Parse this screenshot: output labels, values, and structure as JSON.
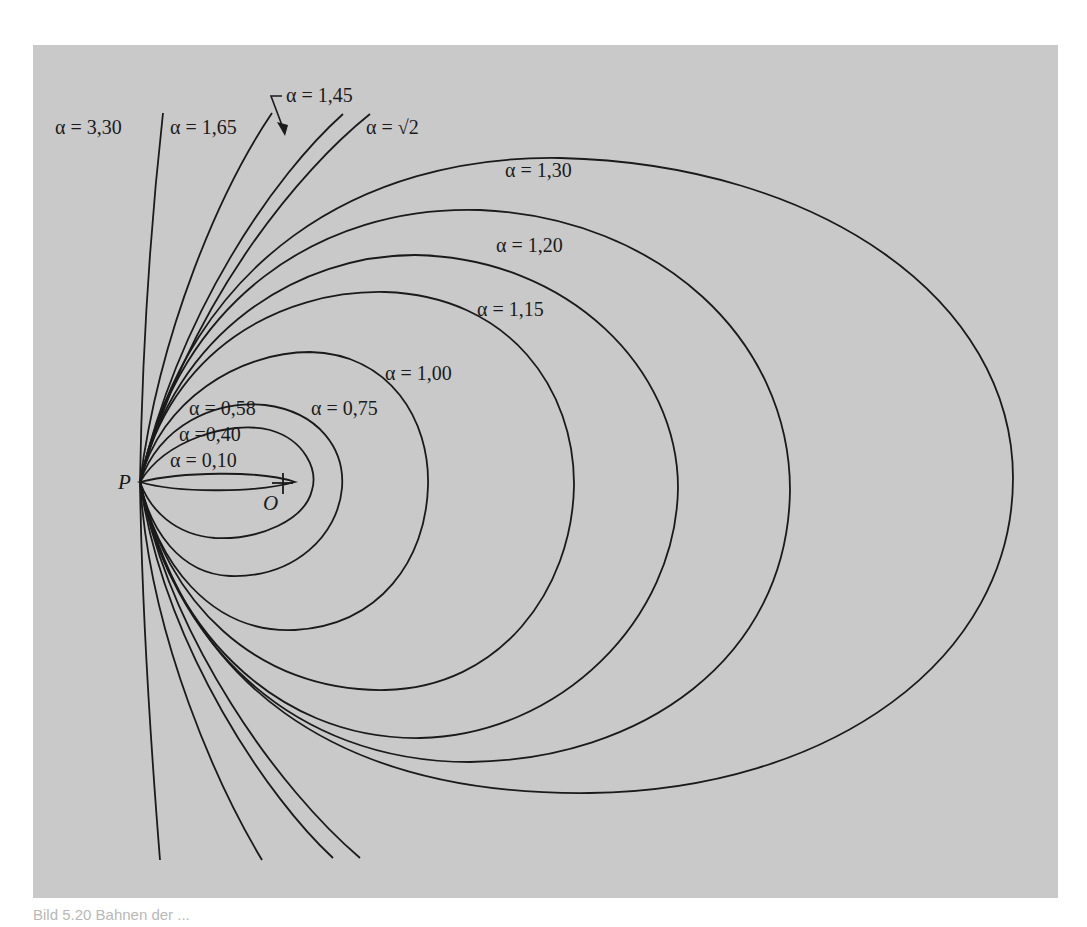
{
  "figure": {
    "point_P": "P",
    "point_O": "O",
    "labels": {
      "a330": "α = 3,30",
      "a165": "α = 1,65",
      "a145": "α = 1,45",
      "asqrt2": "α = √2",
      "a130": "α = 1,30",
      "a120": "α = 1,20",
      "a115": "α = 1,15",
      "a100": "α = 1,00",
      "a075": "α = 0,75",
      "a058": "α = 0,58",
      "a040": "α =0,40",
      "a010": "α = 0,10"
    },
    "caption": "Bild 5.20  Bahnen der ..."
  },
  "diagram": {
    "type": "family-of-curves",
    "parameter": "α",
    "closed_curves": [
      0.1,
      0.4,
      0.58,
      0.75,
      1.0,
      1.15,
      1.2,
      1.3
    ],
    "open_curves": [
      1.4142,
      1.45,
      1.65,
      3.3
    ],
    "common_point": "P",
    "center_marker": "O",
    "colors": {
      "background": "#c9c9c9",
      "stroke": "#1a1a1a",
      "page": "#ffffff"
    }
  }
}
